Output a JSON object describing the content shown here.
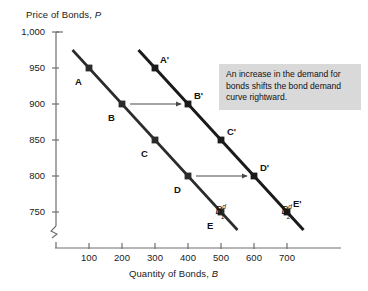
{
  "chart_data": {
    "type": "line",
    "title": "",
    "subtitle": "",
    "xlabel_plain": "Quantity of Bonds, B",
    "xlabel_text": "Quantity of Bonds,",
    "xlabel_italic": "B",
    "ylabel_plain": "Price of Bonds, P",
    "ylabel_text": "Price of Bonds,",
    "ylabel_italic": "P",
    "grid": false,
    "legend_position": "inline-curve-labels",
    "xlim": [
      0,
      760
    ],
    "ylim": [
      735,
      1010
    ],
    "x_axis_break": true,
    "y_axis_break": true,
    "xticks": [
      100,
      200,
      300,
      400,
      500,
      600,
      700
    ],
    "xtick_labels": [
      "100",
      "200",
      "300",
      "400",
      "500",
      "600",
      "700"
    ],
    "yticks": [
      1000,
      950,
      900,
      850,
      800,
      750
    ],
    "ytick_labels": [
      "1,000",
      "950",
      "900",
      "850",
      "800",
      "750"
    ],
    "series": [
      {
        "name": "B1d",
        "label_base": "B",
        "label_sup": "d",
        "label_sub": "1",
        "color": "#2b2b2b",
        "x": [
          100,
          200,
          300,
          400,
          500
        ],
        "y": [
          950,
          900,
          850,
          800,
          750
        ],
        "point_labels": [
          "A",
          "B",
          "C",
          "D",
          "E"
        ],
        "line_x_start": 50,
        "line_y_start": 975,
        "line_x_end": 550,
        "line_y_end": 725
      },
      {
        "name": "B2d",
        "label_base": "B",
        "label_sup": "d",
        "label_sub": "2",
        "color": "#1a1a1a",
        "x": [
          300,
          400,
          500,
          600,
          700
        ],
        "y": [
          950,
          900,
          850,
          800,
          750
        ],
        "point_labels": [
          "A'",
          "B'",
          "C'",
          "D'",
          "E'"
        ],
        "line_x_start": 250,
        "line_y_start": 975,
        "line_x_end": 750,
        "line_y_end": 725
      }
    ],
    "shift_arrows": [
      {
        "from_x": 200,
        "from_y": 900,
        "to_x": 400,
        "to_y": 900
      },
      {
        "from_x": 400,
        "from_y": 800,
        "to_x": 600,
        "to_y": 800
      }
    ],
    "annotation": "An increase in the demand for bonds shifts the bond demand curve rightward.",
    "annotation_bg": "#d9d9d9",
    "axis_color": "#6e6e6e"
  },
  "point_label_offsets": {
    "series1": [
      {
        "dx": -14,
        "dy": 8
      },
      {
        "dx": -14,
        "dy": 8
      },
      {
        "dx": -14,
        "dy": 8
      },
      {
        "dx": -14,
        "dy": 8
      },
      {
        "dx": -14,
        "dy": 8
      }
    ],
    "series2": [
      {
        "dx": 5,
        "dy": -14
      },
      {
        "dx": 6,
        "dy": -14
      },
      {
        "dx": 6,
        "dy": -14
      },
      {
        "dx": 6,
        "dy": -14
      },
      {
        "dx": 6,
        "dy": -14
      }
    ]
  }
}
